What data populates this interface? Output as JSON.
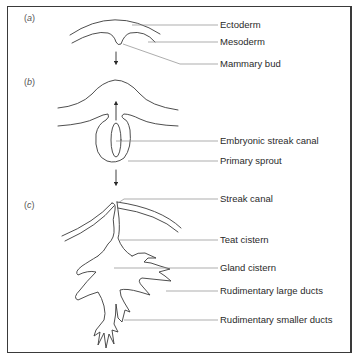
{
  "figure": {
    "panels": [
      {
        "id": "a",
        "label": "a"
      },
      {
        "id": "b",
        "label": "b"
      },
      {
        "id": "c",
        "label": "c"
      }
    ],
    "labels": [
      {
        "text": "Ectoderm",
        "panel": "a"
      },
      {
        "text": "Mesoderm",
        "panel": "a"
      },
      {
        "text": "Mammary bud",
        "panel": "a"
      },
      {
        "text": "Embryonic streak canal",
        "panel": "b"
      },
      {
        "text": "Primary sprout",
        "panel": "b"
      },
      {
        "text": "Streak canal",
        "panel": "c"
      },
      {
        "text": "Teat cistern",
        "panel": "c"
      },
      {
        "text": "Gland cistern",
        "panel": "c"
      },
      {
        "text": "Rudimentary large ducts",
        "panel": "c"
      },
      {
        "text": "Rudimentary smaller ducts",
        "panel": "c"
      }
    ],
    "colors": {
      "line": "#3a3a3a",
      "leader": "#7a7a7a",
      "text": "#2a2a2a",
      "background": "#ffffff"
    }
  }
}
